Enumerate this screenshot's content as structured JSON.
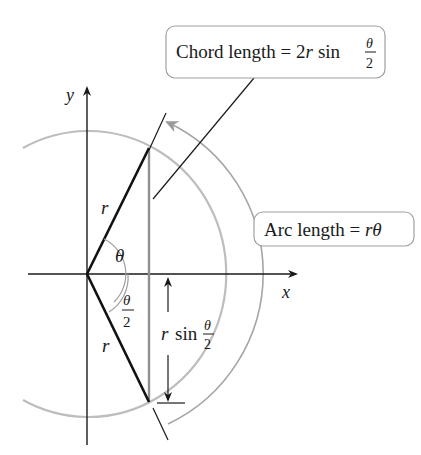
{
  "diagram": {
    "axes": {
      "x_label": "x",
      "y_label": "y"
    },
    "labels": {
      "radius_upper": "r",
      "radius_lower": "r",
      "angle_theta": "θ",
      "half_angle_num": "θ",
      "half_angle_den": "2",
      "half_chord_prefix": "r",
      "half_chord_sin": "sin",
      "half_chord_num": "θ",
      "half_chord_den": "2"
    },
    "callouts": {
      "chord": {
        "text": "Chord length = 2",
        "r": "r",
        "sin": "sin",
        "frac_num": "θ",
        "frac_den": "2"
      },
      "arc": {
        "text": "Arc length = ",
        "value": "rθ"
      }
    },
    "colors": {
      "ink": "#1a1a1a",
      "circle": "#b5b5b5",
      "arc_arrow": "#9a9a9a",
      "chord": "#8a8a8a",
      "box_border": "#9a9a9a"
    }
  }
}
